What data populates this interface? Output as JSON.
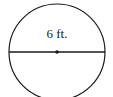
{
  "diagram": {
    "shape": "circle",
    "segment": "diameter",
    "center_point": true,
    "label": "6 ft.",
    "stroke_color": "#1a1a1a"
  }
}
